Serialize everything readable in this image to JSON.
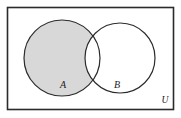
{
  "figure": {
    "type": "venn-diagram",
    "background_color": "#ffffff",
    "stroke_color": "#2b2b2b",
    "shade_color": "#d8d8d8"
  },
  "universe": {
    "label": "U",
    "label_x": 165,
    "label_y": 101,
    "rect": {
      "x": 7.5,
      "y": 7.5,
      "width": 166,
      "height": 102
    },
    "stroke_width": 1.6
  },
  "sets": [
    {
      "label": "A",
      "label_x": 63,
      "label_y": 86,
      "cx": 62,
      "cy": 58,
      "r": 38,
      "shaded": true,
      "stroke_width": 1.2
    },
    {
      "label": "B",
      "label_x": 117,
      "label_y": 86,
      "cx": 120,
      "cy": 58,
      "r": 35,
      "shaded": false,
      "stroke_width": 1.2
    }
  ],
  "shaded_region": {
    "name": "A-minus-B",
    "fill": "#d8d8d8"
  }
}
